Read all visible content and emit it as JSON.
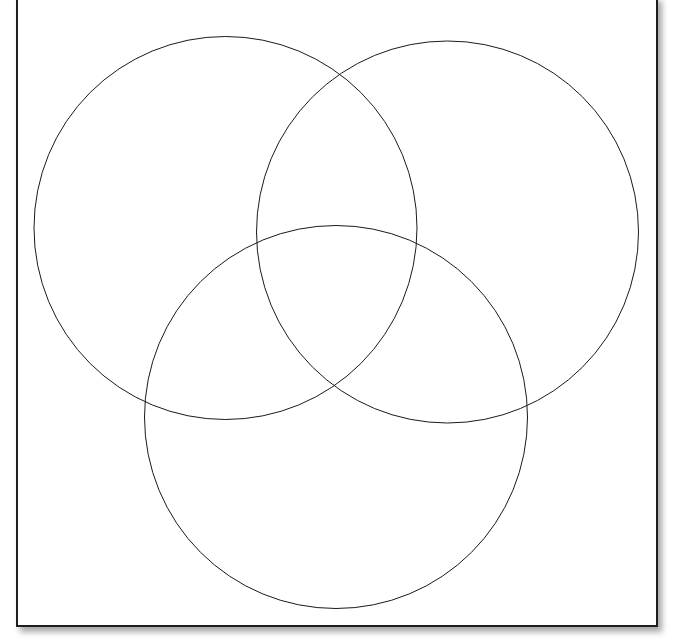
{
  "diagram": {
    "type": "venn",
    "set_count": 3,
    "sets": [
      {
        "id": "left",
        "label": ""
      },
      {
        "id": "right",
        "label": ""
      },
      {
        "id": "bottom",
        "label": ""
      }
    ],
    "stroke_color": "#1a1a1a",
    "fill_color": "none",
    "background": "#ffffff",
    "frame_border_color": "#1e1e1e"
  }
}
